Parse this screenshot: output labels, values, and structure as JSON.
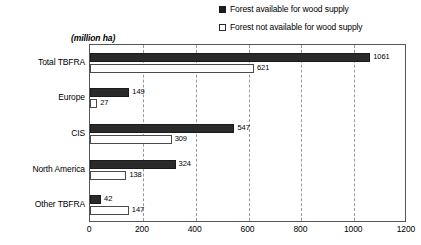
{
  "chart_data": {
    "type": "bar",
    "orientation": "horizontal",
    "title": "",
    "subtitle": "",
    "unit_label": "(million ha)",
    "xlabel": "",
    "ylabel": "",
    "xlim": [
      0,
      1200
    ],
    "xticks": [
      0,
      200,
      400,
      600,
      800,
      1000,
      1200
    ],
    "grid": "vertical-dashed",
    "legend_position": "top-right",
    "categories": [
      "Total TBFRA",
      "Europe",
      "CIS",
      "North America",
      "Other TBFRA"
    ],
    "series": [
      {
        "name": "Forest available for wood supply",
        "marker": "filled-square",
        "color": "#2a2a2a",
        "values": [
          1061,
          149,
          547,
          324,
          42
        ]
      },
      {
        "name": "Forest not available for wood supply",
        "marker": "hollow-square",
        "color": "#ffffff",
        "values": [
          621,
          27,
          309,
          138,
          147
        ]
      }
    ]
  },
  "legend": {
    "items": [
      {
        "label": "Forest available for wood supply",
        "swatch": "filled-square"
      },
      {
        "label": "Forest not available for wood supply",
        "swatch": "hollow-square"
      }
    ]
  },
  "axis": {
    "unit_label": "(million ha)",
    "tick_labels": [
      "0",
      "200",
      "400",
      "600",
      "800",
      "1000",
      "1200"
    ]
  },
  "colors": {
    "available": "#2a2a2a",
    "not_available": "#ffffff",
    "bar_outline": "#4a4a4a",
    "frame": "#555555",
    "gridline": "#9a9a9a",
    "text": "#000000",
    "background": "#ffffff"
  }
}
